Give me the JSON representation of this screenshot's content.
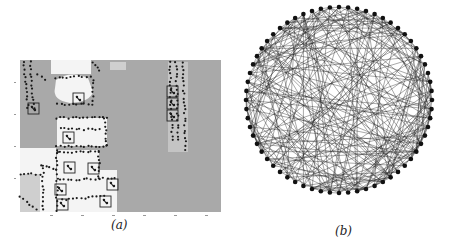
{
  "figure": {
    "subfigures": [
      {
        "id": "a",
        "caption": "(a)",
        "description": "Aerial/occupancy map with dotted boundaries and boxed target markers",
        "colors": {
          "background": "#a9a9a9",
          "free_space": "#f4f4f4",
          "light_gray": "#cfcfcf",
          "dot": "#1a1a1a",
          "box": "#222222"
        },
        "boxes": [
          {
            "x": 28,
            "y": 103,
            "w": 11,
            "h": 11
          },
          {
            "x": 73,
            "y": 93,
            "w": 11,
            "h": 11
          },
          {
            "x": 63,
            "y": 132,
            "w": 11,
            "h": 11
          },
          {
            "x": 64,
            "y": 162,
            "w": 11,
            "h": 11
          },
          {
            "x": 88,
            "y": 163,
            "w": 11,
            "h": 11
          },
          {
            "x": 107,
            "y": 179,
            "w": 11,
            "h": 11
          },
          {
            "x": 55,
            "y": 184,
            "w": 11,
            "h": 11
          },
          {
            "x": 57,
            "y": 199,
            "w": 11,
            "h": 11
          },
          {
            "x": 100,
            "y": 196,
            "w": 11,
            "h": 11
          },
          {
            "x": 167,
            "y": 86,
            "w": 11,
            "h": 11
          },
          {
            "x": 167,
            "y": 98,
            "w": 11,
            "h": 11
          },
          {
            "x": 167,
            "y": 110,
            "w": 11,
            "h": 11
          }
        ]
      },
      {
        "id": "b",
        "caption": "(b)",
        "description": "Circular graph layout, densely connected",
        "node_count": 64,
        "center": {
          "x": 109,
          "y": 100
        },
        "radius": 93,
        "colors": {
          "node": "#111111",
          "edge": "#1e1e1e"
        }
      }
    ]
  }
}
